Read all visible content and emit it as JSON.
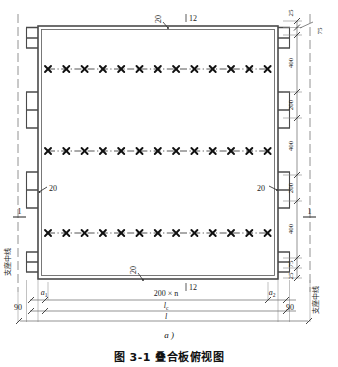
{
  "figure": {
    "caption": "图 3-1   叠合板俯视图",
    "sub_label": "a )",
    "view_type": "plan",
    "colors": {
      "line": "#4a4a4a",
      "rebar": "#1a1a1a",
      "dim": "#555555",
      "text": "#1a1a1a"
    }
  },
  "labels": {
    "support_centerline_left": "支座中线",
    "support_centerline_right": "支座中线",
    "section_mark_left": "1",
    "section_mark_right": "1",
    "edge_note_top": "20",
    "edge_note_bottom": "20",
    "edge_note_left": "20",
    "edge_note_right": "20",
    "rebar_count_top": "12",
    "rebar_count_bottom": "12"
  },
  "dimensions": {
    "right_chain": [
      {
        "value": "25"
      },
      {
        "value": "75"
      },
      {
        "value": "400"
      },
      {
        "value": "200"
      },
      {
        "value": "400"
      },
      {
        "value": "200"
      },
      {
        "value": "400"
      },
      {
        "value": "75"
      },
      {
        "value": "25"
      }
    ],
    "bottom_chain": [
      {
        "value": "a",
        "sub": "1"
      },
      {
        "value": "200 × n"
      },
      {
        "value": "a",
        "sub": "2"
      }
    ],
    "bottom_overall": [
      {
        "value": "90"
      },
      {
        "value": "l",
        "sub": "c"
      },
      {
        "value": "90"
      }
    ],
    "bottom_total": {
      "value": "l"
    }
  },
  "rebar": {
    "row_count": 3,
    "marks_per_row": 13,
    "mark_glyph": "×",
    "rows": [
      {
        "id": "row-1",
        "spacing_label": "400"
      },
      {
        "id": "row-2",
        "spacing_label": "400"
      },
      {
        "id": "row-3",
        "spacing_label": "400"
      }
    ],
    "edge_hook_count_left": 11,
    "edge_hook_count_right": 11
  }
}
